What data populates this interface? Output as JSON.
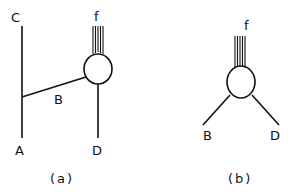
{
  "panels": [
    {
      "caption": "(a)",
      "labels": {
        "top_left": "C",
        "bottom_left": "A",
        "branch": "B",
        "fibers": "f",
        "bottom_right": "D"
      }
    },
    {
      "caption": "(b)",
      "labels": {
        "fibers": "f",
        "left_branch": "B",
        "right_branch": "D"
      }
    }
  ],
  "colors": {
    "line": "#111111",
    "background": "#ffffff"
  }
}
